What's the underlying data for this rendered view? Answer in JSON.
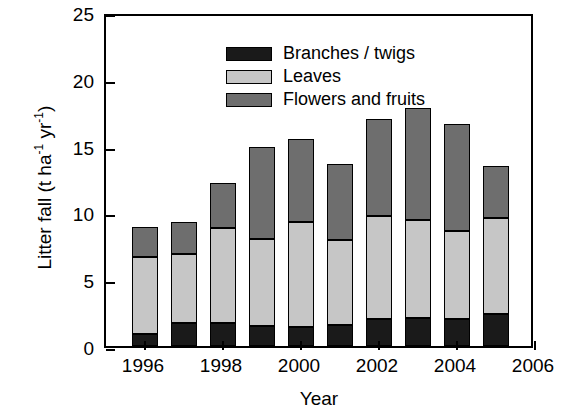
{
  "chart_data": {
    "type": "bar",
    "stacked": true,
    "title": "",
    "xlabel": "Year",
    "ylabel": "Litter fall (t ha-1 yr-1)",
    "ylabel_parts": {
      "prefix": "Litter fall (t ha",
      "sup1": "-1",
      "mid": " yr",
      "sup2": "-1",
      "suffix": ")"
    },
    "categories": [
      1996,
      1997,
      1998,
      1999,
      2000,
      2001,
      2002,
      2003,
      2004,
      2005
    ],
    "series": [
      {
        "name": "Branches / twigs",
        "color": "#1a1a1a",
        "values": [
          0.9,
          1.7,
          1.7,
          1.5,
          1.4,
          1.6,
          2.0,
          2.1,
          2.0,
          2.4
        ]
      },
      {
        "name": "Leaves",
        "color": "#c6c6c6",
        "values": [
          5.8,
          5.2,
          7.1,
          6.5,
          7.9,
          6.3,
          7.7,
          7.3,
          6.6,
          7.2
        ]
      },
      {
        "name": "Flowers and fruits",
        "color": "#6e6e6e",
        "values": [
          2.2,
          2.4,
          3.4,
          6.9,
          6.2,
          5.7,
          7.3,
          8.4,
          8.0,
          3.9
        ]
      }
    ],
    "totals": [
      8.9,
      9.3,
      12.2,
      14.9,
      15.5,
      13.6,
      17.0,
      17.8,
      16.6,
      13.5
    ],
    "xlim": [
      1995,
      2006
    ],
    "ylim": [
      0,
      25
    ],
    "yticks": [
      0,
      5,
      10,
      15,
      20,
      25
    ],
    "ytick_labels": [
      "0",
      "5",
      "10",
      "15",
      "20",
      "25"
    ],
    "xticks": [
      1996,
      1998,
      2000,
      2002,
      2004,
      2006
    ],
    "xtick_labels": [
      "1996",
      "1998",
      "2000",
      "2002",
      "2004",
      "2006"
    ],
    "grid": false,
    "legend_position": "top-left",
    "legend": [
      {
        "label": "Branches / twigs",
        "color": "#1a1a1a"
      },
      {
        "label": "Leaves",
        "color": "#c6c6c6"
      },
      {
        "label": "Flowers and fruits",
        "color": "#6e6e6e"
      }
    ]
  }
}
